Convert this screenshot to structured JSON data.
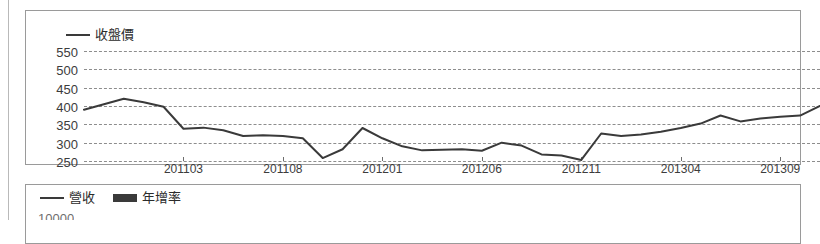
{
  "price_panel": {
    "legend": [
      {
        "label": "收盤價",
        "marker": "line",
        "color": "#3a3a3a"
      }
    ]
  },
  "revenue_panel": {
    "legend": [
      {
        "label": "營收",
        "marker": "line",
        "color": "#3a3a3a"
      },
      {
        "label": "年增率",
        "marker": "bar",
        "color": "#3a3a3a"
      }
    ],
    "clipped_axis_label": "10000"
  },
  "chart_data": {
    "type": "line",
    "title": "",
    "subtitle": "",
    "xlabel": "",
    "ylabel": "",
    "grid": true,
    "legend_position": "top-left",
    "ylim": [
      250,
      550
    ],
    "yticks": [
      550,
      500,
      450,
      400,
      350,
      300,
      250
    ],
    "xticks": [
      "201103",
      "201108",
      "201201",
      "201206",
      "201211",
      "201304",
      "201309"
    ],
    "xtick_indices": [
      5,
      10,
      15,
      20,
      25,
      30,
      35
    ],
    "series": [
      {
        "name": "收盤價",
        "color": "#3a3a3a",
        "x": [
          "201010",
          "201011",
          "201012",
          "201101",
          "201102",
          "201103",
          "201104",
          "201105",
          "201106",
          "201107",
          "201108",
          "201109",
          "201110",
          "201111",
          "201112",
          "201201",
          "201202",
          "201203",
          "201204",
          "201205",
          "201206",
          "201207",
          "201208",
          "201209",
          "201210",
          "201211",
          "201212",
          "201301",
          "201302",
          "201303",
          "201304",
          "201305",
          "201306",
          "201307",
          "201308",
          "201309",
          "201310",
          "201311"
        ],
        "values": [
          390,
          405,
          420,
          410,
          398,
          338,
          341,
          334,
          318,
          320,
          318,
          312,
          258,
          282,
          340,
          312,
          290,
          279,
          281,
          282,
          278,
          300,
          292,
          268,
          265,
          253,
          325,
          318,
          322,
          330,
          340,
          352,
          374,
          358,
          366,
          371,
          374,
          400
        ]
      }
    ]
  }
}
